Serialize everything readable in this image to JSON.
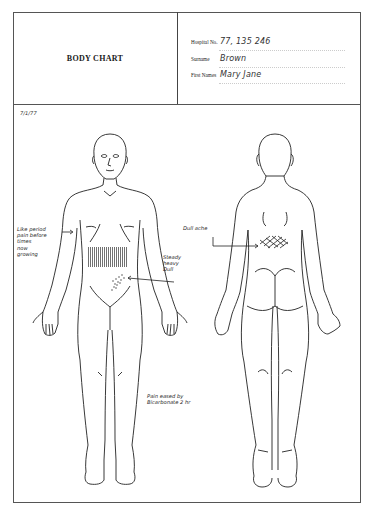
{
  "document": {
    "title": "BODY CHART",
    "patient": {
      "hospital_no_label": "Hospital No.",
      "hospital_no_value": "77, 135 246",
      "surname_label": "Surname",
      "surname_value": "Brown",
      "first_names_label": "First Names",
      "first_names_value": "Mary Jane"
    },
    "date": "7/1/77",
    "figures": [
      {
        "view": "front",
        "label": "anterior-body-outline"
      },
      {
        "view": "back",
        "label": "posterior-body-outline"
      }
    ],
    "annotations": {
      "left_note": [
        "Like period",
        "pain before",
        "times",
        "now",
        "growing"
      ],
      "right_note": [
        "Steady",
        "heavy",
        "Dull"
      ],
      "back_note": "Dull ache",
      "bottom_note": [
        "Pain eased by",
        "Bicarbonate 2 hr"
      ]
    },
    "marks": {
      "abdomen_shading": "vertical-hatching",
      "groin_shading": "dotted-cross-hatching",
      "back_shading": "cross-hatching"
    }
  }
}
